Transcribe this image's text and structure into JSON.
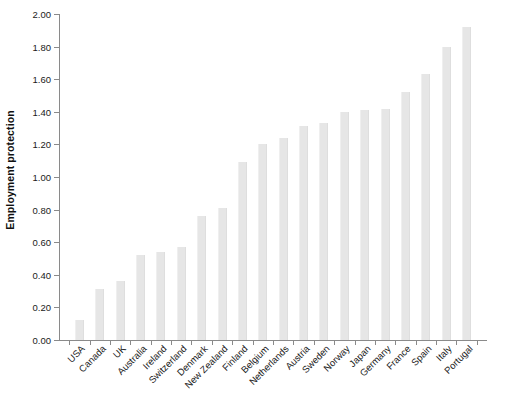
{
  "chart": {
    "ylabel": "Employment protection",
    "xlabel": ""
  },
  "chart_data": {
    "type": "bar",
    "title": "",
    "subtitle": "",
    "xlabel": "",
    "ylabel": "Employment protection",
    "ylim": [
      0.0,
      2.0
    ],
    "ytick_labels": [
      "0.00",
      "0.20",
      "0.40",
      "0.60",
      "0.80",
      "1.00",
      "1.20",
      "1.40",
      "1.60",
      "1.80",
      "2.00"
    ],
    "ytick_values": [
      0.0,
      0.2,
      0.4,
      0.6,
      0.8,
      1.0,
      1.2,
      1.4,
      1.6,
      1.8,
      2.0
    ],
    "grid": false,
    "legend": false,
    "bar_color": "#e6e6e6",
    "axis_color": "#8a8a8a",
    "categories": [
      "USA",
      "Canada",
      "UK",
      "Australia",
      "Ireland",
      "Switzerland",
      "Denmark",
      "New Zealand",
      "Finland",
      "Belgium",
      "Netherlands",
      "Austria",
      "Sweden",
      "Norway",
      "Japan",
      "Germany",
      "France",
      "Spain",
      "Italy",
      "Portugal"
    ],
    "values": [
      0.12,
      0.31,
      0.36,
      0.52,
      0.54,
      0.57,
      0.76,
      0.81,
      1.09,
      1.2,
      1.24,
      1.31,
      1.33,
      1.4,
      1.41,
      1.42,
      1.52,
      1.63,
      1.8,
      1.92
    ]
  }
}
